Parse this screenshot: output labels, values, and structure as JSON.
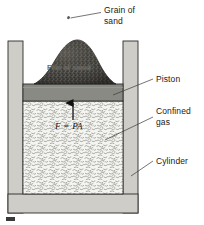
{
  "figure": {
    "labels": {
      "grain_of_sand": "Grain of\nsand",
      "pile_of_sand": "Pile of sand",
      "piston": "Piston",
      "confined_gas": "Confined\ngas",
      "cylinder": "Cylinder"
    },
    "equation": "F = PA",
    "colors": {
      "cylinder_wall": "#cfcdc7",
      "piston": "#8a8a85",
      "gas_fill": "#f2f2ef",
      "sand": "#4c4a45",
      "outline": "#2b2b2b",
      "leader_line": "#3a3a3a",
      "background": "#ffffff"
    },
    "elements": {
      "grain_marker": "grain-of-sand-speck",
      "force_arrow": "upward-arrow",
      "caption_marker": "figure-caption-mark"
    }
  }
}
